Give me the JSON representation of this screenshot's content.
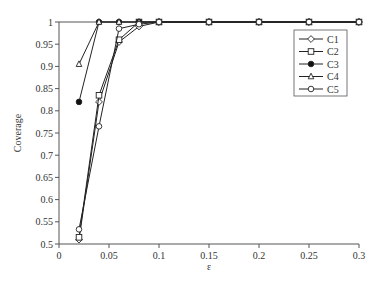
{
  "chart_data": {
    "type": "line",
    "title": "",
    "xlabel": "ε",
    "ylabel": "Coverage",
    "xlim": [
      0,
      0.3
    ],
    "ylim": [
      0.5,
      1
    ],
    "xticks": [
      "0",
      "0.05",
      "0.1",
      "0.15",
      "0.2",
      "0.25",
      "0.3"
    ],
    "yticks": [
      "0.5",
      "0.55",
      "0.6",
      "0.65",
      "0.7",
      "0.75",
      "0.8",
      "0.85",
      "0.9",
      "0.95",
      "1"
    ],
    "grid": false,
    "legend_position": "upper right",
    "series": [
      {
        "name": "C1",
        "marker": "diamond-open",
        "x": [
          0.02,
          0.04,
          0.06,
          0.08,
          0.1,
          0.15,
          0.2,
          0.25,
          0.3
        ],
        "values": [
          0.51,
          0.82,
          0.955,
          0.99,
          1,
          1,
          1,
          1,
          1
        ]
      },
      {
        "name": "C2",
        "marker": "square-open",
        "x": [
          0.02,
          0.04,
          0.06,
          0.08,
          0.1,
          0.15,
          0.2,
          0.25,
          0.3
        ],
        "values": [
          0.515,
          0.835,
          0.96,
          1,
          1,
          1,
          1,
          1,
          1
        ]
      },
      {
        "name": "C3",
        "marker": "star-filled",
        "x": [
          0.02,
          0.04,
          0.06,
          0.08,
          0.1,
          0.15,
          0.2,
          0.25,
          0.3
        ],
        "values": [
          0.82,
          1,
          1,
          1,
          1,
          1,
          1,
          1,
          1
        ]
      },
      {
        "name": "C4",
        "marker": "triangle-open",
        "x": [
          0.02,
          0.04,
          0.06,
          0.08,
          0.1,
          0.15,
          0.2,
          0.25,
          0.3
        ],
        "values": [
          0.905,
          1,
          1,
          1,
          1,
          1,
          1,
          1,
          1
        ]
      },
      {
        "name": "C5",
        "marker": "circle-open",
        "x": [
          0.02,
          0.04,
          0.06,
          0.08,
          0.1,
          0.15,
          0.2,
          0.25,
          0.3
        ],
        "values": [
          0.533,
          0.765,
          0.985,
          0.995,
          1,
          1,
          1,
          1,
          1
        ]
      }
    ]
  }
}
